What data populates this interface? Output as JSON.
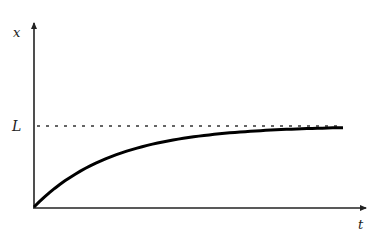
{
  "chart_data": {
    "type": "line",
    "title": "",
    "xlabel": "t",
    "ylabel": "x",
    "asymptote_label": "L",
    "grid": false,
    "legend": null,
    "series": [
      {
        "name": "x(t)",
        "style": "solid-thick",
        "x": [
          0,
          0.1,
          0.2,
          0.3,
          0.4,
          0.5,
          0.6,
          0.7,
          0.8,
          0.9,
          1.0
        ],
        "values": [
          0,
          0.32,
          0.54,
          0.69,
          0.79,
          0.86,
          0.9,
          0.93,
          0.95,
          0.97,
          0.98
        ]
      },
      {
        "name": "L",
        "style": "dashed",
        "x": [
          0,
          1.0
        ],
        "values": [
          1,
          1
        ]
      }
    ],
    "xlim": [
      0,
      1.06
    ],
    "ylim": [
      0,
      2.27
    ],
    "annotations": [
      {
        "text": "L",
        "position": "left of y-axis at asymptote level"
      }
    ]
  },
  "labels": {
    "y_axis": "x",
    "x_axis": "t",
    "asymptote": "L"
  },
  "colors": {
    "axis": "#222222",
    "curve": "#000000",
    "dashed": "#333333"
  }
}
